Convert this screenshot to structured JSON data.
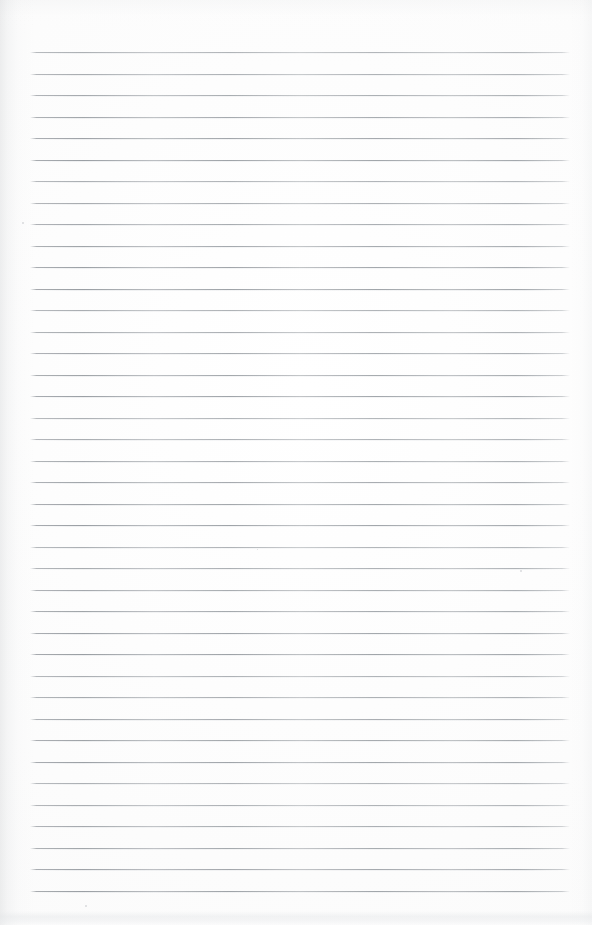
{
  "document": {
    "kind": "scanned-blank-lined-page",
    "title": "",
    "body_text": "",
    "handwriting": "",
    "printed_text": "",
    "page_number": "",
    "header_text": "",
    "footer_text": ""
  },
  "canvas": {
    "width": 592,
    "height": 925,
    "paper_color": "#fdfdfd",
    "background_color": "#ffffff"
  },
  "ruling": {
    "line_color": "#9aa0a5",
    "line_count": 40,
    "first_line_y": 52,
    "line_spacing": 21.5,
    "line_left_x": 30,
    "line_right_x": 570,
    "line_thickness": 1,
    "lines_y": [
      52,
      73.5,
      95,
      116.5,
      138,
      159.5,
      181,
      202.5,
      224,
      245.5,
      267,
      288.5,
      310,
      331.5,
      353,
      374.5,
      396,
      417.5,
      439,
      460.5,
      482,
      503.5,
      525,
      546.5,
      568,
      589.5,
      611,
      632.5,
      654,
      675.5,
      697,
      718.5,
      740,
      761.5,
      783,
      804.5,
      826,
      847.5,
      869,
      890.5
    ]
  },
  "artifacts": {
    "left_edge_shadow": true,
    "right_edge_shadow": true,
    "top_edge_shadow": true,
    "bottom_smudge_y": 911,
    "specks": [
      {
        "x": 22,
        "y": 222,
        "size": 2
      },
      {
        "x": 520,
        "y": 570,
        "size": 2
      },
      {
        "x": 257,
        "y": 549,
        "size": 1
      },
      {
        "x": 85,
        "y": 905,
        "size": 2
      }
    ]
  }
}
